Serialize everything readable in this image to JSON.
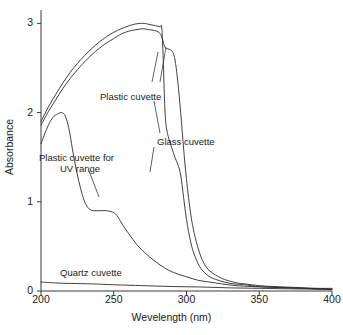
{
  "chart_data": {
    "type": "line",
    "title": "",
    "xlabel": "Wevelength (nm)",
    "ylabel": "Absorbance",
    "xlim": [
      200,
      400
    ],
    "ylim": [
      0,
      3.15
    ],
    "xticks": [
      200,
      250,
      300,
      350,
      400
    ],
    "yticks": [
      0,
      1,
      2,
      3
    ],
    "grid": false,
    "legend_position": "inline-annotations",
    "line_color": "#2b2b2b",
    "background_color": "#ffffff",
    "series": [
      {
        "name": "Plastic cuvette",
        "label": "Plastic cuvette",
        "x": [
          200,
          205,
          210,
          215,
          220,
          225,
          230,
          235,
          240,
          245,
          250,
          255,
          258,
          262,
          266,
          270,
          274,
          278,
          281,
          283,
          284,
          285,
          286,
          288,
          290,
          292,
          294,
          296,
          298,
          300,
          303,
          306,
          310,
          314,
          318,
          322,
          326,
          330,
          335,
          340,
          350,
          360,
          375,
          390,
          400
        ],
        "y": [
          1.86,
          2.01,
          2.14,
          2.27,
          2.38,
          2.48,
          2.57,
          2.65,
          2.72,
          2.78,
          2.83,
          2.88,
          2.9,
          2.92,
          2.93,
          2.94,
          2.93,
          2.92,
          2.9,
          2.85,
          2.79,
          2.74,
          2.72,
          2.71,
          2.69,
          2.6,
          2.35,
          2.0,
          1.6,
          1.25,
          0.85,
          0.6,
          0.38,
          0.26,
          0.2,
          0.16,
          0.13,
          0.11,
          0.09,
          0.08,
          0.06,
          0.05,
          0.04,
          0.03,
          0.03
        ]
      },
      {
        "name": "Glass cuvette",
        "label": "Glass cuvette",
        "x": [
          200,
          205,
          210,
          215,
          220,
          225,
          230,
          235,
          240,
          245,
          250,
          255,
          260,
          264,
          268,
          271,
          274,
          277,
          280,
          282,
          283,
          284,
          285,
          286,
          288,
          290,
          292,
          294,
          296,
          298,
          300,
          303,
          306,
          310,
          315,
          320,
          326,
          332,
          340,
          350,
          365,
          380,
          400
        ],
        "y": [
          1.9,
          2.06,
          2.2,
          2.33,
          2.45,
          2.55,
          2.64,
          2.72,
          2.79,
          2.85,
          2.9,
          2.94,
          2.97,
          2.99,
          3.0,
          3.0,
          2.99,
          2.98,
          2.97,
          2.96,
          2.95,
          2.6,
          2.1,
          1.85,
          1.7,
          1.6,
          1.5,
          1.42,
          1.3,
          1.05,
          0.8,
          0.54,
          0.38,
          0.25,
          0.17,
          0.13,
          0.1,
          0.08,
          0.07,
          0.05,
          0.04,
          0.03,
          0.02
        ]
      },
      {
        "name": "Plastic cuvette for UV range",
        "label": "Plastic cuvette for\nUV range",
        "label_line1": "Plastic cuvette for",
        "label_line2": "UV range",
        "x": [
          200,
          203,
          206,
          209,
          212,
          214,
          216,
          218,
          220,
          222,
          224,
          226,
          228,
          230,
          232,
          234,
          236,
          240,
          245,
          248,
          250,
          252,
          254,
          257,
          260,
          264,
          268,
          272,
          277,
          282,
          288,
          294,
          300,
          308,
          316,
          324,
          334,
          345,
          360,
          380,
          400
        ],
        "y": [
          1.65,
          1.78,
          1.89,
          1.96,
          1.99,
          2.0,
          1.98,
          1.9,
          1.75,
          1.55,
          1.38,
          1.23,
          1.1,
          1.0,
          0.94,
          0.91,
          0.9,
          0.9,
          0.9,
          0.89,
          0.88,
          0.85,
          0.8,
          0.72,
          0.65,
          0.56,
          0.48,
          0.42,
          0.35,
          0.29,
          0.23,
          0.19,
          0.16,
          0.12,
          0.1,
          0.08,
          0.06,
          0.05,
          0.04,
          0.03,
          0.02
        ]
      },
      {
        "name": "Quartz cuvette",
        "label": "Quartz cuvette",
        "x": [
          200,
          210,
          220,
          235,
          250,
          270,
          290,
          310,
          330,
          350,
          370,
          390,
          400
        ],
        "y": [
          0.1,
          0.09,
          0.085,
          0.08,
          0.07,
          0.06,
          0.05,
          0.045,
          0.035,
          0.03,
          0.025,
          0.02,
          0.015
        ]
      }
    ],
    "annotations": [
      {
        "name": "plastic-cuvette-label",
        "text": "Plastic cuvette",
        "x_px": 100,
        "y_px": 91
      },
      {
        "name": "glass-cuvette-label",
        "text": "Glass cuvette",
        "x_px": 157,
        "y_px": 136
      },
      {
        "name": "uv-plastic-label-line1",
        "text": "Plastic cuvette for",
        "x_px": 39,
        "y_px": 152
      },
      {
        "name": "uv-plastic-label-line2",
        "text": "UV range",
        "x_px": 60,
        "y_px": 163
      },
      {
        "name": "quartz-cuvette-label",
        "text": "Quartz cuvette",
        "x_px": 60,
        "y_px": 267
      }
    ]
  },
  "axes": {
    "x_title": "Wevelength (nm)",
    "y_title": "Absorbance",
    "x_tick_labels": [
      "200",
      "250",
      "300",
      "350",
      "400"
    ],
    "y_tick_labels": [
      "0",
      "1",
      "2",
      "3"
    ]
  }
}
